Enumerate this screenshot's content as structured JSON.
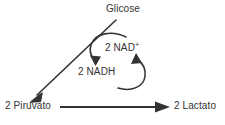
{
  "diagram": {
    "title_label": "Glicose",
    "nad_plus_label": "2 NAD",
    "nad_plus_charge": "+",
    "nadh_label": "2 NADH",
    "pyruvate_label": "2 Piruvato",
    "lactate_label": "2 Lactato",
    "stroke_color": "#333333",
    "text_color": "#333333",
    "background_color": "#ffffff"
  }
}
